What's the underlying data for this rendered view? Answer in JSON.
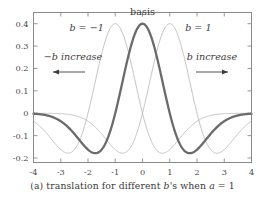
{
  "figure": {
    "caption_prefix": "(a) translation for different ",
    "caption_var_b": "b",
    "caption_mid": "'s when ",
    "caption_var_a": "a",
    "caption_suffix": " = 1",
    "caption_full": "(a) translation for different b's when a = 1"
  },
  "annotations": {
    "basis_label": "basis",
    "left_curve_label": "b = −1",
    "right_curve_label": "b = 1",
    "left_arrow_label": "−b increase",
    "right_arrow_label": "b increase"
  },
  "axes": {
    "x_ticks": [
      "-4",
      "-3",
      "-2",
      "-1",
      "0",
      "1",
      "2",
      "3",
      "4"
    ],
    "x_tick_values": [
      -4,
      -3,
      -2,
      -1,
      0,
      1,
      2,
      3,
      4
    ],
    "y_ticks": [
      "0.4",
      "0.3",
      "0.2",
      "0.1",
      "0",
      "-0.1",
      "-0.2"
    ],
    "y_tick_values": [
      0.4,
      0.3,
      0.2,
      0.1,
      0,
      -0.1,
      -0.2
    ],
    "xlim": [
      -4,
      4
    ],
    "ylim": [
      -0.22,
      0.45
    ]
  },
  "colors": {
    "frame": "#8a8a8a",
    "basis_curve": "#6b6b6b",
    "side_curve": "#b8b8b8",
    "text": "#3a3a3a",
    "background": "#ffffff"
  },
  "chart_data": {
    "type": "line",
    "title": "",
    "subtitle": "",
    "xlabel": "",
    "ylabel": "",
    "xlim": [
      -4,
      4
    ],
    "ylim": [
      -0.22,
      0.45
    ],
    "grid": false,
    "legend_position": "inline-annotations",
    "function": "Mexican hat (Ricker) wavelet, a = 1, peak amplitude 0.40, trough -0.18",
    "annotations": [
      {
        "text": "basis",
        "x": 0,
        "y": 0.45
      },
      {
        "text": "b = -1",
        "x": -2.1,
        "y": 0.37
      },
      {
        "text": "b = 1",
        "x": 2.1,
        "y": 0.37
      },
      {
        "text": "-b increase",
        "x": -2.6,
        "y": 0.23
      },
      {
        "text": "b increase",
        "x": 2.6,
        "y": 0.23
      }
    ],
    "series": [
      {
        "name": "b = -1",
        "shift": -1,
        "style": "thin-light-gray",
        "peak_x": -1,
        "peak_y": 0.4,
        "troughs": [
          {
            "x": -2.7,
            "y": -0.178
          },
          {
            "x": 0.7,
            "y": -0.178
          }
        ],
        "x": [
          -4,
          -3.8,
          -3.6,
          -3.4,
          -3.2,
          -3,
          -2.8,
          -2.6,
          -2.4,
          -2.2,
          -2,
          -1.8,
          -1.6,
          -1.4,
          -1.2,
          -1,
          -0.8,
          -0.6,
          -0.4,
          -0.2,
          0,
          0.2,
          0.4,
          0.6,
          0.8,
          1,
          1.2,
          1.4,
          1.6,
          1.8,
          2,
          2.2,
          2.4,
          2.6,
          2.8,
          3,
          3.2,
          3.4,
          3.6,
          3.8,
          4
        ],
        "values": [
          -0.035,
          -0.052,
          -0.073,
          -0.098,
          -0.124,
          -0.15,
          -0.172,
          -0.177,
          -0.163,
          -0.125,
          -0.06,
          0.033,
          0.147,
          0.268,
          0.364,
          0.4,
          0.364,
          0.268,
          0.147,
          0.033,
          -0.06,
          -0.125,
          -0.163,
          -0.177,
          -0.172,
          -0.15,
          -0.124,
          -0.098,
          -0.073,
          -0.052,
          -0.035,
          -0.022,
          -0.013,
          -0.007,
          -0.003,
          -0.001,
          0.001,
          0.002,
          0.002,
          0.002,
          0.002
        ]
      },
      {
        "name": "basis (b = 0)",
        "shift": 0,
        "style": "thick-dark-gray",
        "peak_x": 0,
        "peak_y": 0.4,
        "troughs": [
          {
            "x": -1.7,
            "y": -0.178
          },
          {
            "x": 1.7,
            "y": -0.178
          }
        ],
        "x": [
          -4,
          -3.8,
          -3.6,
          -3.4,
          -3.2,
          -3,
          -2.8,
          -2.6,
          -2.4,
          -2.2,
          -2,
          -1.8,
          -1.6,
          -1.4,
          -1.2,
          -1,
          -0.8,
          -0.6,
          -0.4,
          -0.2,
          0,
          0.2,
          0.4,
          0.6,
          0.8,
          1,
          1.2,
          1.4,
          1.6,
          1.8,
          2,
          2.2,
          2.4,
          2.6,
          2.8,
          3,
          3.2,
          3.4,
          3.6,
          3.8,
          4
        ],
        "values": [
          -0.003,
          -0.007,
          -0.013,
          -0.022,
          -0.035,
          -0.052,
          -0.073,
          -0.098,
          -0.124,
          -0.15,
          -0.172,
          -0.177,
          -0.163,
          -0.125,
          -0.06,
          0.033,
          0.147,
          0.268,
          0.364,
          0.4,
          0.4,
          0.4,
          0.364,
          0.268,
          0.147,
          0.033,
          -0.06,
          -0.125,
          -0.163,
          -0.177,
          -0.172,
          -0.15,
          -0.124,
          -0.098,
          -0.073,
          -0.052,
          -0.035,
          -0.022,
          -0.013,
          -0.007,
          -0.003
        ]
      },
      {
        "name": "b = 1",
        "shift": 1,
        "style": "thin-light-gray",
        "peak_x": 1,
        "peak_y": 0.4,
        "troughs": [
          {
            "x": -0.7,
            "y": -0.178
          },
          {
            "x": 2.7,
            "y": -0.178
          }
        ],
        "x": [
          -4,
          -3.8,
          -3.6,
          -3.4,
          -3.2,
          -3,
          -2.8,
          -2.6,
          -2.4,
          -2.2,
          -2,
          -1.8,
          -1.6,
          -1.4,
          -1.2,
          -1,
          -0.8,
          -0.6,
          -0.4,
          -0.2,
          0,
          0.2,
          0.4,
          0.6,
          0.8,
          1,
          1.2,
          1.4,
          1.6,
          1.8,
          2,
          2.2,
          2.4,
          2.6,
          2.8,
          3,
          3.2,
          3.4,
          3.6,
          3.8,
          4
        ],
        "values": [
          0.002,
          0.002,
          0.002,
          0.002,
          0.001,
          -0.001,
          -0.003,
          -0.007,
          -0.013,
          -0.022,
          -0.035,
          -0.052,
          -0.073,
          -0.098,
          -0.124,
          -0.15,
          -0.172,
          -0.177,
          -0.163,
          -0.125,
          -0.06,
          0.033,
          0.147,
          0.268,
          0.364,
          0.4,
          0.364,
          0.268,
          0.147,
          0.033,
          -0.06,
          -0.125,
          -0.163,
          -0.177,
          -0.172,
          -0.15,
          -0.124,
          -0.098,
          -0.073,
          -0.052,
          -0.035
        ]
      }
    ]
  }
}
